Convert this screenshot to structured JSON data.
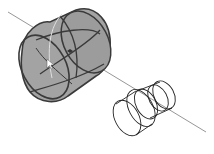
{
  "diagram": {
    "type": "3d-wireframe-cad-view",
    "colors": {
      "background": "#ffffff",
      "axis": "#8a8a8a",
      "shaded_fill": "#a3a3a3",
      "shaded_fill_dark": "#8c8c8c",
      "edge_dark": "#3a3a3a",
      "edge_light": "#d8d8d8",
      "wire": "#222222"
    },
    "objects": [
      {
        "name": "axis-line",
        "kind": "line"
      },
      {
        "name": "shaded-cylinder",
        "kind": "selected-solid"
      },
      {
        "name": "wireframe-stepped-cylinder",
        "kind": "wireframe-solid"
      },
      {
        "name": "cursor-arrow",
        "kind": "pointer"
      }
    ]
  }
}
